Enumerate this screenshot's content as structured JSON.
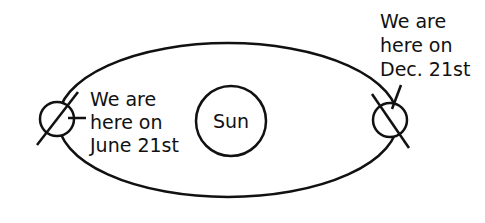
{
  "diagram": {
    "sun": {
      "label": "Sun"
    },
    "june": {
      "lines": [
        "We are",
        "here on",
        "June 21st"
      ]
    },
    "december": {
      "lines": [
        "We are",
        "here on",
        "Dec. 21st"
      ]
    },
    "colors": {
      "stroke": "#111111",
      "background": "#ffffff"
    }
  }
}
